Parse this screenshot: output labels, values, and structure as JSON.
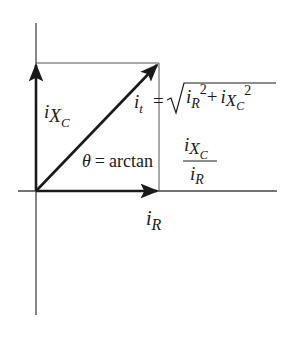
{
  "diagram": {
    "labels": {
      "capacitive_current": {
        "base": "i",
        "sub": "X",
        "subsub": "C"
      },
      "resistive_current": {
        "base": "i",
        "sub": "R"
      },
      "total_current": {
        "base": "i",
        "sub": "t"
      },
      "total_eq": "=",
      "sqrt_term1_base": "i",
      "sqrt_term1_sub": "R",
      "sqrt_term1_sup": "2",
      "sqrt_plus": "+",
      "sqrt_term2_base": "i",
      "sqrt_term2_sub": "X",
      "sqrt_term2_subsub": "C",
      "sqrt_term2_sup": "2",
      "theta": "θ",
      "theta_eq": "=",
      "arctan": "arctan",
      "frac_num_base": "i",
      "frac_num_sub": "X",
      "frac_num_subsub": "C",
      "frac_den_base": "i",
      "frac_den_sub": "R"
    },
    "colors": {
      "ink": "#1a1a1a",
      "axis": "#444444",
      "guide": "#555555"
    }
  }
}
